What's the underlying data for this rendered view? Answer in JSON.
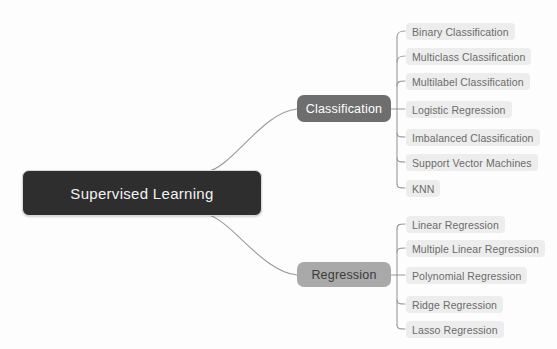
{
  "diagram": {
    "title": "Supervised Learning",
    "type": "mind-map",
    "colors": {
      "background": "#fdfdfd",
      "root_fill": "#2e2e2e",
      "root_text": "#f2f2f2",
      "root_border": "#d9d9d9",
      "classification_fill": "#6e6e6e",
      "classification_text": "#ffffff",
      "regression_fill": "#a9a9a9",
      "regression_text": "#3b3b3b",
      "leaf_fill": "#ededed",
      "leaf_text": "#6b6b6b",
      "connector": "#9a9a9a"
    },
    "root": {
      "label": "Supervised Learning"
    },
    "branches": [
      {
        "label": "Classification",
        "children": [
          {
            "label": "Binary Classification"
          },
          {
            "label": "Multiclass Classification"
          },
          {
            "label": "Multilabel Classification"
          },
          {
            "label": "Logistic Regression"
          },
          {
            "label": "Imbalanced Classification"
          },
          {
            "label": "Support Vector Machines"
          },
          {
            "label": "KNN"
          }
        ]
      },
      {
        "label": "Regression",
        "children": [
          {
            "label": "Linear Regression"
          },
          {
            "label": "Multiple Linear Regression"
          },
          {
            "label": "Polynomial Regression"
          },
          {
            "label": "Ridge Regression"
          },
          {
            "label": "Lasso Regression"
          }
        ]
      }
    ]
  }
}
